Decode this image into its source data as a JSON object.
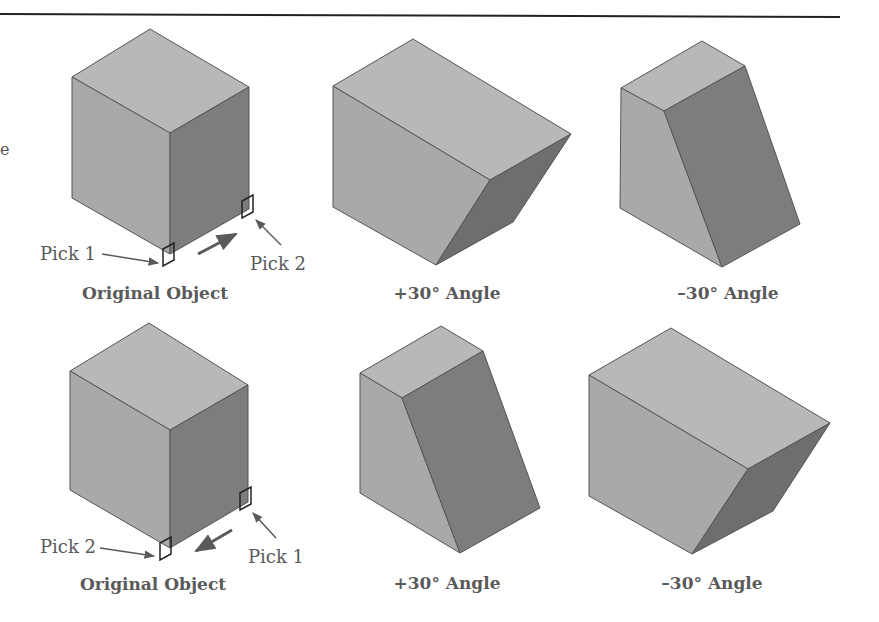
{
  "figure": {
    "rule_color": "#222222",
    "colors": {
      "top_face": "#b8b8b8",
      "left_face": "#a9a9a9",
      "right_face": "#7d7d7d",
      "edge": "#555555",
      "annotation": "#5a5a5a"
    },
    "edge_fragment": "e",
    "rows": [
      {
        "panels": [
          {
            "caption": "Original Object",
            "pick_left": "Pick 1",
            "pick_right": "Pick 2",
            "direction": "toward-back"
          },
          {
            "caption": "+30° Angle"
          },
          {
            "caption": "–30° Angle"
          }
        ]
      },
      {
        "panels": [
          {
            "caption": "Original Object",
            "pick_left": "Pick 2",
            "pick_right": "Pick 1",
            "direction": "toward-front"
          },
          {
            "caption": "+30° Angle"
          },
          {
            "caption": "–30° Angle"
          }
        ]
      }
    ]
  }
}
